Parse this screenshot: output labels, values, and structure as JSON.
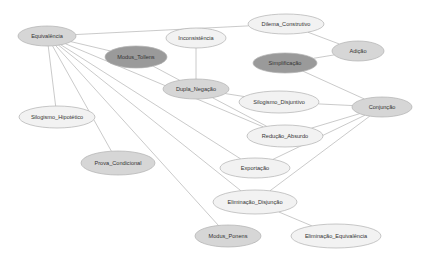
{
  "title": "",
  "colors": {
    "light": "#f2f2f2",
    "medium": "#d6d6d6",
    "dark": "#9a9a9a",
    "edge": "#bdbdbd"
  },
  "nodes": [
    {
      "id": "equivalencia",
      "label": "Equivalência",
      "x": 47,
      "y": 36,
      "rx": 29,
      "ry": 10,
      "shade": "medium"
    },
    {
      "id": "dilema_construtivo",
      "label": "Dilema_Construtivo",
      "x": 286,
      "y": 24,
      "rx": 38,
      "ry": 10,
      "shade": "light"
    },
    {
      "id": "inconsistencia",
      "label": "Inconsistência",
      "x": 196,
      "y": 38,
      "rx": 30,
      "ry": 10,
      "shade": "light"
    },
    {
      "id": "adicao",
      "label": "Adição",
      "x": 358,
      "y": 51,
      "rx": 26,
      "ry": 10,
      "shade": "medium"
    },
    {
      "id": "modus_tollens",
      "label": "Modus_Tollens",
      "x": 136,
      "y": 57,
      "rx": 31,
      "ry": 11,
      "shade": "dark"
    },
    {
      "id": "simplificacao",
      "label": "Simplificação",
      "x": 285,
      "y": 63,
      "rx": 32,
      "ry": 10,
      "shade": "dark"
    },
    {
      "id": "dupla_negacao",
      "label": "Dupla_Negação",
      "x": 196,
      "y": 89,
      "rx": 33,
      "ry": 10,
      "shade": "medium"
    },
    {
      "id": "silogismo_disjuntivo",
      "label": "Silogismo_Disjuntivo",
      "x": 279,
      "y": 102,
      "rx": 40,
      "ry": 11,
      "shade": "light"
    },
    {
      "id": "conjuncao",
      "label": "Conjunção",
      "x": 382,
      "y": 107,
      "rx": 30,
      "ry": 10,
      "shade": "medium"
    },
    {
      "id": "silogismo_hipotetico",
      "label": "Silogismo_Hipotético",
      "x": 57,
      "y": 117,
      "rx": 38,
      "ry": 11,
      "shade": "light"
    },
    {
      "id": "reducao_absurdo",
      "label": "Redução_Absurdo",
      "x": 285,
      "y": 136,
      "rx": 38,
      "ry": 11,
      "shade": "light"
    },
    {
      "id": "prova_condicional",
      "label": "Prova_Condicional",
      "x": 118,
      "y": 163,
      "rx": 37,
      "ry": 12,
      "shade": "medium"
    },
    {
      "id": "exportacao",
      "label": "Exportação",
      "x": 255,
      "y": 168,
      "rx": 35,
      "ry": 10,
      "shade": "light"
    },
    {
      "id": "eliminacao_disjuncao",
      "label": "Eliminação_Disjunção",
      "x": 255,
      "y": 202,
      "rx": 42,
      "ry": 12,
      "shade": "light"
    },
    {
      "id": "modus_ponens",
      "label": "Modus_Ponens",
      "x": 228,
      "y": 236,
      "rx": 33,
      "ry": 11,
      "shade": "medium"
    },
    {
      "id": "eliminacao_equivalencia",
      "label": "Eliminação_Equivalência",
      "x": 336,
      "y": 236,
      "rx": 45,
      "ry": 12,
      "shade": "light"
    }
  ],
  "edges": [
    [
      "equivalencia",
      "dilema_construtivo"
    ],
    [
      "equivalencia",
      "modus_tollens"
    ],
    [
      "equivalencia",
      "silogismo_hipotetico"
    ],
    [
      "equivalencia",
      "prova_condicional"
    ],
    [
      "equivalencia",
      "exportacao"
    ],
    [
      "equivalencia",
      "eliminacao_disjuncao"
    ],
    [
      "equivalencia",
      "modus_ponens"
    ],
    [
      "equivalencia",
      "reducao_absurdo"
    ],
    [
      "modus_tollens",
      "dupla_negacao"
    ],
    [
      "dupla_negacao",
      "inconsistencia"
    ],
    [
      "dupla_negacao",
      "silogismo_disjuntivo"
    ],
    [
      "dupla_negacao",
      "reducao_absurdo"
    ],
    [
      "dilema_construtivo",
      "adicao"
    ],
    [
      "adicao",
      "simplificacao"
    ],
    [
      "conjuncao",
      "simplificacao"
    ],
    [
      "conjuncao",
      "silogismo_disjuntivo"
    ],
    [
      "conjuncao",
      "reducao_absurdo"
    ],
    [
      "conjuncao",
      "exportacao"
    ],
    [
      "conjuncao",
      "eliminacao_disjuncao"
    ],
    [
      "eliminacao_disjuncao",
      "eliminacao_equivalencia"
    ]
  ]
}
